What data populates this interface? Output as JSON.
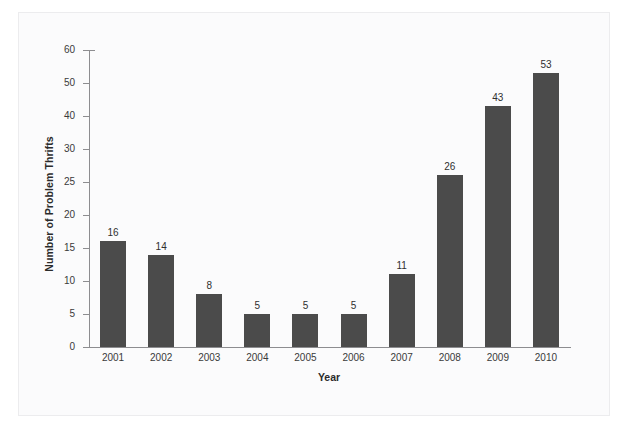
{
  "top_caption": "",
  "chart_data": {
    "type": "bar",
    "title": "",
    "subtitle": "",
    "xlabel": "Year",
    "ylabel": "Number of Problem Thrifts",
    "categories": [
      "2001",
      "2002",
      "2003",
      "2004",
      "2005",
      "2006",
      "2007",
      "2008",
      "2009",
      "2010"
    ],
    "values": [
      16,
      14,
      8,
      5,
      5,
      5,
      11,
      26,
      43,
      53
    ],
    "value_labels": [
      "16",
      "14",
      "8",
      "5",
      "5",
      "5",
      "11",
      "26",
      "43",
      "53"
    ],
    "ytick_labels": [
      "0",
      "5",
      "10",
      "15",
      "20",
      "25",
      "30",
      "40",
      "50",
      "60"
    ],
    "ytick_values": [
      0,
      5,
      10,
      15,
      20,
      25,
      30,
      40,
      50,
      60
    ],
    "ylim": [
      0,
      60
    ],
    "grid": false,
    "legend": false,
    "legend_position": "none",
    "axis_note": "y-axis ticks are evenly spaced in pixels although the value steps change from 5 to 10 above 30",
    "colors": {
      "bar": "#4b4b4b",
      "axis": "#8d8d90",
      "text": "#2f2f2f",
      "plot_background": "#ffffff",
      "panel_background": "#fbfbfc",
      "panel_border": "#ececee"
    }
  }
}
